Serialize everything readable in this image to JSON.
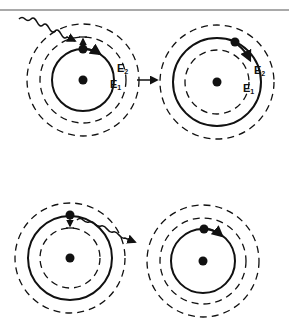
{
  "diagram": {
    "colors": {
      "ink": "#111111",
      "rule": "#555555",
      "background": "#ffffff"
    },
    "top_rule": {
      "y": 10
    },
    "panels": [
      {
        "id": "absorption-before",
        "center": [
          83,
          80
        ],
        "orbits": {
          "outer_dashed": 56,
          "middle_dashed": 43,
          "solid": 31
        },
        "electron_on": "E1",
        "photon": "incoming",
        "labels": {
          "E2": "E",
          "E2_sub": "2",
          "E1": "E",
          "E1_sub": "1"
        }
      },
      {
        "id": "absorption-after",
        "center": [
          217,
          82
        ],
        "orbits": {
          "outer_dashed": 57,
          "solid": 44,
          "inner_dashed": 32
        },
        "electron_on": "E2",
        "labels": {
          "E2": "E",
          "E2_sub": "2",
          "E1": "E",
          "E1_sub": "1"
        }
      },
      {
        "id": "emission-before",
        "center": [
          70,
          258
        ],
        "orbits": {
          "outer_dashed": 55,
          "solid": 42,
          "inner_dashed": 30
        },
        "electron_on": "excited",
        "photon": "outgoing"
      },
      {
        "id": "emission-after",
        "center": [
          203,
          261
        ],
        "orbits": {
          "outer_dashed": 56,
          "middle_dashed": 43,
          "solid": 32
        },
        "electron_on": "ground"
      }
    ],
    "transition_arrow": {
      "from": [
        137,
        80
      ],
      "to": [
        157,
        80
      ]
    }
  }
}
